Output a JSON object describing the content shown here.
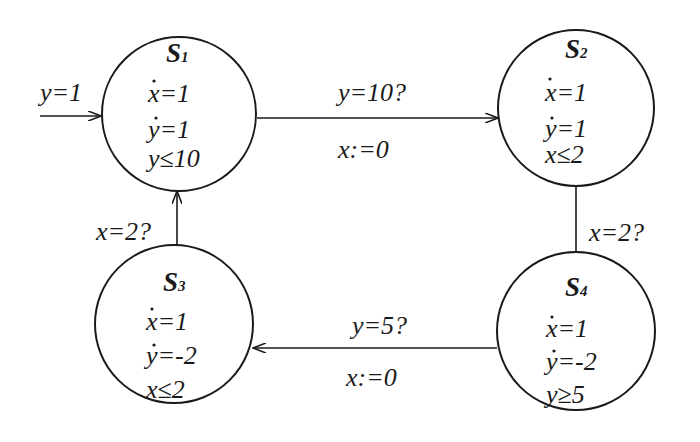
{
  "diagram": {
    "type": "hybrid-automaton",
    "colors": {
      "stroke": "#1a1a1a",
      "background": "#ffffff"
    },
    "initial": {
      "label": "y=1",
      "target": "S1"
    },
    "states": [
      {
        "id": "S1",
        "name": "S",
        "index": "1",
        "flow_x": "x=1",
        "flow_y": "y=1",
        "invariant": "y≤10"
      },
      {
        "id": "S2",
        "name": "S",
        "index": "2",
        "flow_x": "x=1",
        "flow_y": "y=1",
        "invariant": "x≤2"
      },
      {
        "id": "S3",
        "name": "S",
        "index": "3",
        "flow_x": "x=1",
        "flow_y": "y=-2",
        "invariant": "x≤2"
      },
      {
        "id": "S4",
        "name": "S",
        "index": "4",
        "flow_x": "x=1",
        "flow_y": "y=-2",
        "invariant": "y≥5"
      }
    ],
    "transitions": [
      {
        "from": "S1",
        "to": "S2",
        "guard": "y=10?",
        "reset": "x:=0"
      },
      {
        "from": "S2",
        "to": "S4",
        "guard": "x=2?",
        "reset": ""
      },
      {
        "from": "S4",
        "to": "S3",
        "guard": "y=5?",
        "reset": "x:=0"
      },
      {
        "from": "S3",
        "to": "S1",
        "guard": "x=2?",
        "reset": ""
      }
    ]
  }
}
